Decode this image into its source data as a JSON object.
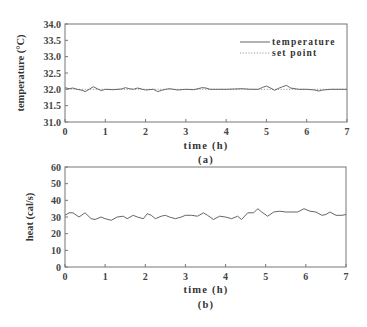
{
  "chart_data": [
    {
      "type": "line",
      "panel_label": "(a)",
      "title": "",
      "xlabel": "time (h)",
      "ylabel": "temperature (°C)",
      "xlim": [
        0,
        7
      ],
      "ylim": [
        31.0,
        34.0
      ],
      "xticks": [
        "0",
        "1",
        "2",
        "3",
        "4",
        "5",
        "6",
        "7"
      ],
      "yticks": [
        "31.0",
        "31.5",
        "32.0",
        "32.5",
        "33.0",
        "33.5",
        "34.0"
      ],
      "grid": false,
      "legend_position": "upper right",
      "series": [
        {
          "name": "temperature",
          "style": "solid",
          "x": [
            0,
            0.1,
            0.2,
            0.3,
            0.4,
            0.5,
            0.6,
            0.7,
            0.8,
            0.9,
            1.0,
            1.2,
            1.4,
            1.5,
            1.6,
            1.7,
            1.8,
            1.9,
            2.0,
            2.2,
            2.3,
            2.4,
            2.5,
            2.6,
            2.8,
            3.0,
            3.2,
            3.4,
            3.5,
            3.6,
            3.8,
            4.0,
            4.2,
            4.4,
            4.6,
            4.8,
            4.9,
            5.0,
            5.1,
            5.2,
            5.3,
            5.4,
            5.5,
            5.6,
            5.8,
            6.0,
            6.2,
            6.3,
            6.4,
            6.6,
            6.8,
            7.0
          ],
          "y": [
            32.05,
            32.02,
            32.04,
            32.0,
            31.98,
            31.93,
            32.0,
            32.08,
            32.02,
            31.96,
            32.0,
            31.99,
            32.01,
            32.05,
            32.02,
            32.0,
            32.04,
            32.01,
            31.98,
            32.0,
            31.93,
            31.97,
            32.0,
            32.02,
            31.98,
            32.0,
            31.99,
            32.05,
            32.04,
            32.0,
            32.0,
            32.0,
            32.01,
            32.02,
            32.0,
            32.0,
            32.06,
            32.1,
            32.04,
            31.97,
            32.03,
            32.08,
            32.12,
            32.04,
            32.0,
            32.0,
            31.98,
            31.95,
            31.98,
            32.0,
            32.0,
            32.0
          ]
        },
        {
          "name": "set point",
          "style": "dotted",
          "x": [
            0,
            7
          ],
          "y": [
            32.0,
            32.0
          ]
        }
      ]
    },
    {
      "type": "line",
      "panel_label": "(b)",
      "title": "",
      "xlabel": "time (h)",
      "ylabel": "heat (cal/s)",
      "xlim": [
        0,
        7
      ],
      "ylim": [
        0,
        60
      ],
      "xticks": [
        "0",
        "1",
        "2",
        "3",
        "4",
        "5",
        "6",
        "7"
      ],
      "yticks": [
        "0",
        "10",
        "20",
        "30",
        "40",
        "50",
        "60"
      ],
      "grid": false,
      "series": [
        {
          "name": "heat",
          "style": "solid",
          "x": [
            0,
            0.1,
            0.2,
            0.35,
            0.5,
            0.65,
            0.75,
            0.9,
            1.0,
            1.15,
            1.3,
            1.45,
            1.55,
            1.7,
            1.8,
            1.95,
            2.05,
            2.15,
            2.25,
            2.4,
            2.5,
            2.6,
            2.75,
            2.9,
            3.0,
            3.15,
            3.3,
            3.45,
            3.55,
            3.7,
            3.85,
            4.0,
            4.15,
            4.3,
            4.4,
            4.55,
            4.7,
            4.8,
            4.9,
            5.05,
            5.2,
            5.35,
            5.5,
            5.65,
            5.8,
            5.95,
            6.1,
            6.25,
            6.4,
            6.5,
            6.6,
            6.75,
            6.9,
            7.0
          ],
          "y": [
            31,
            32.5,
            32.5,
            30,
            32.5,
            29,
            28.5,
            30,
            29,
            28,
            30,
            30.5,
            29,
            31,
            30,
            29,
            32,
            31,
            29,
            30.5,
            31,
            30,
            29,
            30,
            31,
            31,
            30.5,
            32.5,
            31,
            28.5,
            30.5,
            30,
            29,
            30.5,
            28.5,
            32.5,
            32.5,
            35,
            33,
            30.5,
            33,
            33.5,
            33,
            33,
            33,
            35,
            33.5,
            33,
            31,
            31.5,
            33,
            31,
            31,
            31.5
          ]
        }
      ]
    }
  ]
}
